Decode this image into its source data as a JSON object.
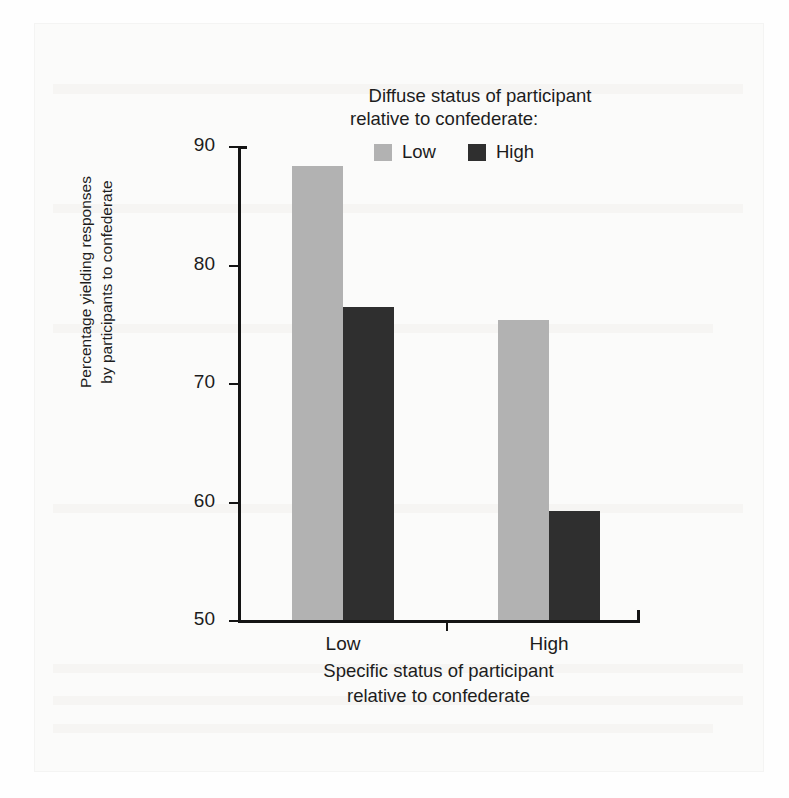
{
  "figure": {
    "legend": {
      "title_line1": "Diffuse status of participant",
      "title_line2": "relative to confederate:",
      "entries": [
        {
          "label": "Low",
          "color": "#b2b2b2"
        },
        {
          "label": "High",
          "color": "#2f2f2f"
        }
      ]
    },
    "y_axis_title_line1": "Percentage yielding responses",
    "y_axis_title_line2": "by participants to confederate",
    "x_axis_title_line1": "Specific status of participant",
    "x_axis_title_line2": "relative to confederate"
  },
  "chart_data": {
    "type": "bar",
    "title": "",
    "subtitle": "",
    "xlabel": "Specific status of participant relative to confederate",
    "ylabel": "Percentage yielding responses by participants to confederate",
    "categories": [
      "Low",
      "High"
    ],
    "series": [
      {
        "name": "Low",
        "color": "#b2b2b2",
        "values": [
          88.3,
          75.3
        ]
      },
      {
        "name": "High",
        "color": "#2f2f2f",
        "values": [
          76.4,
          59.2
        ]
      }
    ],
    "ylim": [
      50,
      90
    ],
    "yticks": [
      50,
      60,
      70,
      80,
      90
    ],
    "ytick_labels": [
      "50",
      "60",
      "70",
      "80",
      "90"
    ],
    "grid": false,
    "legend_position": "top",
    "legend_title": "Diffuse status of participant relative to confederate:"
  }
}
